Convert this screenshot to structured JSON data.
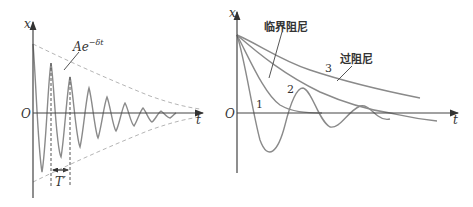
{
  "left_panel": {
    "y_axis_label": "x",
    "x_axis_label": "t",
    "origin_label": "O",
    "envelope_label": "Ae",
    "envelope_exponent": "−δt",
    "period_label": "T′"
  },
  "right_panel": {
    "y_axis_label": "x",
    "x_axis_label": "t",
    "origin_label": "O",
    "critical_damping_label": "临界阻尼",
    "over_damping_label": "过阻尼",
    "curve_labels": [
      "1",
      "2",
      "3"
    ]
  },
  "colors": {
    "axis": "#444444",
    "curve": "#8a8a8a",
    "envelope": "#b5b5b5"
  }
}
